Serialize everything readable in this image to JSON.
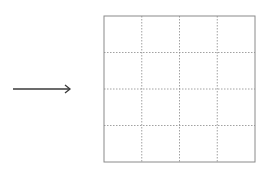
{
  "diagram": {
    "arrow": {
      "x1": 13,
      "x2": 70,
      "y": 89,
      "color": "#3a3a3a",
      "direction": "right"
    },
    "grid": {
      "x": 104,
      "y": 16,
      "width": 151,
      "height": 146,
      "rows": 4,
      "cols": 4,
      "border_color": "#8a8a8a",
      "line_color": "#8a8a8a"
    }
  }
}
